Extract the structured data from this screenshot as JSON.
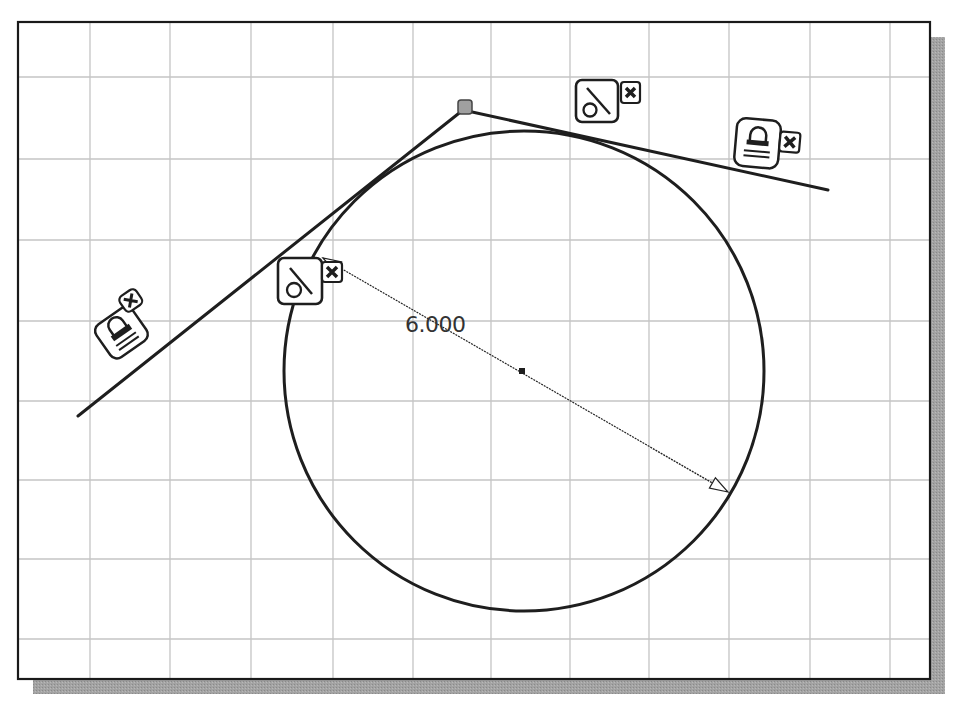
{
  "canvas": {
    "frame": {
      "x": 18,
      "y": 22,
      "width": 912,
      "height": 657
    },
    "shadow_offset": 15,
    "shadow_color": "#9a9a9a",
    "border_color": "#1a1a1a",
    "grid_color": "#c4c4c4",
    "grid_x": [
      90,
      170,
      251,
      333,
      413,
      491,
      570,
      649,
      729,
      810,
      890
    ],
    "grid_y": [
      77,
      159,
      240,
      321,
      401,
      480,
      559,
      639
    ]
  },
  "sketch": {
    "line_color": "#1e1e1e",
    "circle": {
      "cx": 524,
      "cy": 371,
      "r": 240
    },
    "center_point": {
      "x": 522,
      "y": 371
    },
    "vertex_point": {
      "x": 465,
      "y": 107,
      "fill": "#a0a0a0"
    },
    "left_line": {
      "x1": 78,
      "y1": 416,
      "x2": 463,
      "y2": 110
    },
    "right_line": {
      "x1": 463,
      "y1": 110,
      "x2": 828,
      "y2": 190
    }
  },
  "dimension": {
    "type": "diameter",
    "value": "6.000",
    "label_x": 405,
    "label_y": 332,
    "x1": 323,
    "y1": 258,
    "x2": 728,
    "y2": 492
  },
  "constraints": [
    {
      "id": "fix-left-line",
      "kind": "fix",
      "icon": "lock-icon",
      "x": 98,
      "y": 298,
      "rotate": -35
    },
    {
      "id": "tangent-left",
      "kind": "tangent",
      "icon": "tangent-icon",
      "x": 278,
      "y": 258
    },
    {
      "id": "tangent-right",
      "kind": "tangent",
      "icon": "tangent-icon",
      "x": 576,
      "y": 80
    },
    {
      "id": "fix-right-line",
      "kind": "fix",
      "icon": "lock-icon",
      "x": 735,
      "y": 120,
      "rotate": 5
    }
  ]
}
